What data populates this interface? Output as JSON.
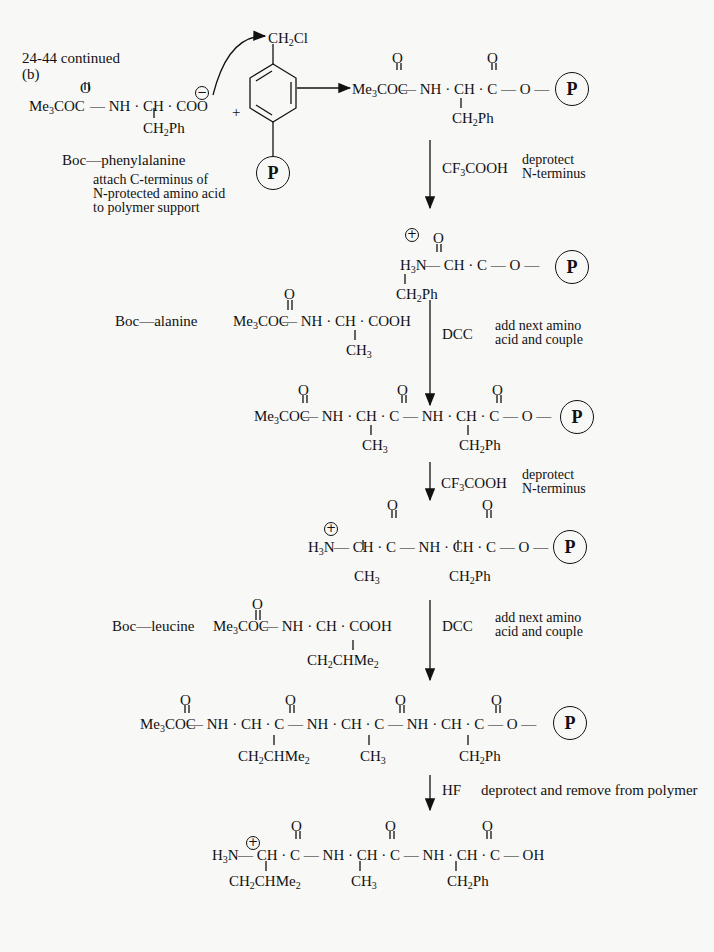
{
  "header": {
    "problem": "24-44 continued",
    "part": "(b)"
  },
  "step0": {
    "reactant_label": "Boc—phenylalanine",
    "reactant": {
      "o": "O",
      "main": "Me3COC",
      "chain": "— NH · CH · COO",
      "side": "CH2Ph",
      "charge": "−"
    },
    "plus": "+",
    "resin": {
      "top": "CH2Cl",
      "support": "P"
    },
    "note_lines": [
      "attach C-terminus of",
      "N-protected amino acid",
      "to polymer support"
    ]
  },
  "product1": {
    "o1": "O",
    "o2": "O",
    "main": "Me3COC",
    "chain": "— NH · CH · C — O —",
    "side": "CH2Ph",
    "support": "P"
  },
  "arrow1": {
    "reagent": "CF3COOH",
    "note_lines": [
      "deprotect",
      "N-terminus"
    ]
  },
  "product2": {
    "charge": "+",
    "o1": "O",
    "main": "H3N",
    "chain": "— CH · C — O —",
    "side": "CH2Ph",
    "support": "P"
  },
  "arrow2": {
    "amino_label": "Boc—alanine",
    "amino": {
      "o": "O",
      "main": "Me3COC",
      "chain": "— NH · CH · COOH",
      "side": "CH3"
    },
    "reagent": "DCC",
    "note_lines": [
      "add next amino",
      "acid and couple"
    ]
  },
  "product3": {
    "main": "Me3COC",
    "chain": "— NH · CH · C — NH · CH · C — O —",
    "sides": [
      "CH3",
      "CH2Ph"
    ],
    "o": "O",
    "support": "P"
  },
  "arrow3": {
    "reagent": "CF3COOH",
    "note_lines": [
      "deprotect",
      "N-terminus"
    ]
  },
  "product4": {
    "charge": "+",
    "main": "H3N",
    "chain": "— CH · C — NH · CH · C — O —",
    "sides": [
      "CH3",
      "CH2Ph"
    ],
    "o": "O",
    "support": "P"
  },
  "arrow4": {
    "amino_label": "Boc—leucine",
    "amino": {
      "o": "O",
      "main": "Me3COC",
      "chain": "— NH · CH · COOH",
      "side": "CH2CHMe2"
    },
    "reagent": "DCC",
    "note_lines": [
      "add next amino",
      "acid and couple"
    ]
  },
  "product5": {
    "main": "Me3COC",
    "chain": "— NH · CH · C — NH · CH · C — NH · CH · C — O —",
    "sides": [
      "CH2CHMe2",
      "CH3",
      "CH2Ph"
    ],
    "o": "O",
    "support": "P"
  },
  "arrow5": {
    "reagent": "HF",
    "note": "deprotect and remove from polymer"
  },
  "final": {
    "charge": "+",
    "main": "H3N",
    "chain": "— CH · C — NH · CH · C — NH · CH · C — OH",
    "sides": [
      "CH2CHMe2",
      "CH3",
      "CH2Ph"
    ],
    "o": "O"
  }
}
